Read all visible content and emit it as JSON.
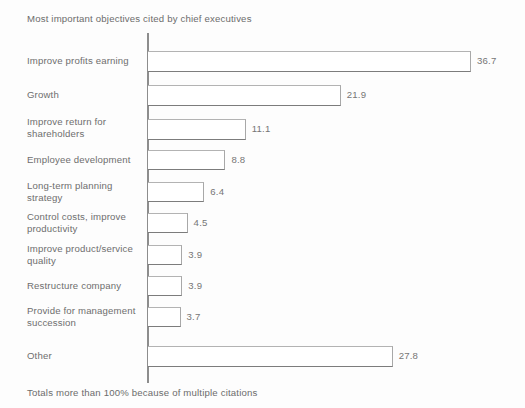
{
  "chart_data": {
    "type": "bar",
    "orientation": "horizontal",
    "title": "Most important objectives cited by chief executives",
    "footnote": "Totals more than 100% because of multiple citations",
    "xlabel": "",
    "ylabel": "",
    "grid": false,
    "legend": null,
    "xlim": [
      0,
      36.7
    ],
    "categories": [
      "Improve profits earning",
      "Growth",
      "Improve return for shareholders",
      "Employee development",
      "Long-term planning strategy",
      "Control costs, improve productivity",
      "Improve product/service quality",
      "Restructure company",
      "Provide for management succession",
      "Other"
    ],
    "values": [
      36.7,
      21.9,
      11.1,
      8.8,
      6.4,
      4.5,
      3.9,
      3.9,
      3.7,
      27.8
    ],
    "bars": [
      {
        "label_line1": "Improve profits earning",
        "label_line2": "",
        "value": 36.7,
        "value_text": "36.7"
      },
      {
        "label_line1": "Growth",
        "label_line2": "",
        "value": 21.9,
        "value_text": "21.9"
      },
      {
        "label_line1": "Improve return for",
        "label_line2": "shareholders",
        "value": 11.1,
        "value_text": "11.1"
      },
      {
        "label_line1": "Employee development",
        "label_line2": "",
        "value": 8.8,
        "value_text": "8.8"
      },
      {
        "label_line1": "Long-term planning",
        "label_line2": "strategy",
        "value": 6.4,
        "value_text": "6.4"
      },
      {
        "label_line1": "Control costs, improve",
        "label_line2": "productivity",
        "value": 4.5,
        "value_text": "4.5"
      },
      {
        "label_line1": "Improve product/service",
        "label_line2": "quality",
        "value": 3.9,
        "value_text": "3.9"
      },
      {
        "label_line1": "Restructure company",
        "label_line2": "",
        "value": 3.9,
        "value_text": "3.9"
      },
      {
        "label_line1": "Provide for management",
        "label_line2": "succession",
        "value": 3.7,
        "value_text": "3.7"
      },
      {
        "label_line1": "Other",
        "label_line2": "",
        "value": 27.8,
        "value_text": "27.8"
      }
    ],
    "colors": {
      "bar_fill": "#ffffff",
      "bar_outline": "#8d8d8d",
      "axis": "#8d8d8d",
      "text": "#6c6c6c",
      "background": "#fdfdfd"
    }
  }
}
